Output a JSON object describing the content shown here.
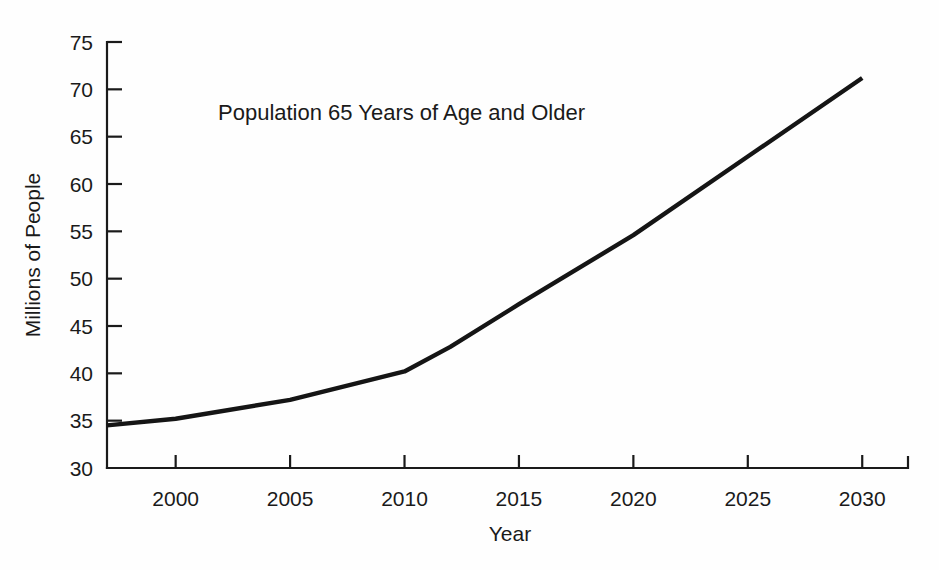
{
  "chart_data": {
    "type": "line",
    "title": "Population 65 Years of Age and Older",
    "xlabel": "Year",
    "ylabel": "Millions of People",
    "xlim": [
      1997,
      2032
    ],
    "ylim": [
      30,
      75
    ],
    "grid": false,
    "legend": null,
    "xticks": [
      "2000",
      "2005",
      "2010",
      "2015",
      "2020",
      "2025",
      "2030"
    ],
    "xtick_values": [
      2000,
      2005,
      2010,
      2015,
      2020,
      2025,
      2030
    ],
    "yticks": [
      "30",
      "35",
      "40",
      "45",
      "50",
      "55",
      "60",
      "65",
      "70",
      "75"
    ],
    "ytick_values": [
      30,
      35,
      40,
      45,
      50,
      55,
      60,
      65,
      70,
      75
    ],
    "series": [
      {
        "name": "Population 65 Years of Age and Older",
        "color": "#151515",
        "x": [
          1997,
          2000,
          2005,
          2010,
          2012,
          2015,
          2020,
          2025,
          2030
        ],
        "values": [
          34.5,
          35.2,
          37.2,
          40.2,
          42.8,
          47.3,
          54.6,
          62.9,
          71.2
        ]
      }
    ],
    "annotations": []
  },
  "labels": {
    "title": "Population 65 Years of Age and Older",
    "x_axis_title": "Year",
    "y_axis_title": "Millions of People"
  }
}
